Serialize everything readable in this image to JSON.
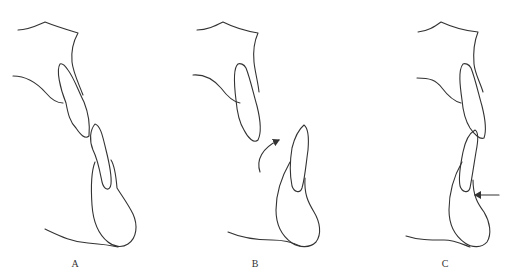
{
  "figure": {
    "type": "dental profile diagrams (incisor relationship)",
    "panels": [
      {
        "id": "A",
        "label": "A",
        "annotation": "none"
      },
      {
        "id": "B",
        "label": "B",
        "annotation": "curved arrow indicating lower incisor rotation/forward movement"
      },
      {
        "id": "C",
        "label": "C",
        "annotation": "horizontal left-pointing arrow at lower incisor labial surface"
      }
    ],
    "colors": {
      "line": "#333333",
      "background": "#ffffff"
    }
  }
}
